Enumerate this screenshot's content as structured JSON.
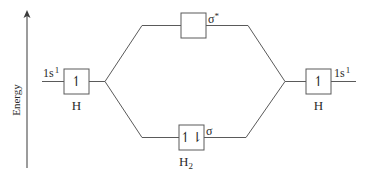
{
  "axis": {
    "label": "Energy",
    "direction": "up"
  },
  "atoms": {
    "left": {
      "orbital_label": "1s",
      "orbital_superscript": "1",
      "electrons": "↿",
      "atom_label": "H"
    },
    "right": {
      "orbital_label": "1s",
      "orbital_superscript": "1",
      "electrons": "↿",
      "atom_label": "H"
    }
  },
  "molecule": {
    "antibonding": {
      "label": "σ",
      "superscript": "*",
      "electrons": ""
    },
    "bonding": {
      "label": "σ",
      "electrons": "↿⇂"
    },
    "name": "H",
    "name_subscript": "2"
  },
  "colors": {
    "line": "#5a5a5a",
    "text": "#2a2a2a",
    "background": "#ffffff"
  }
}
